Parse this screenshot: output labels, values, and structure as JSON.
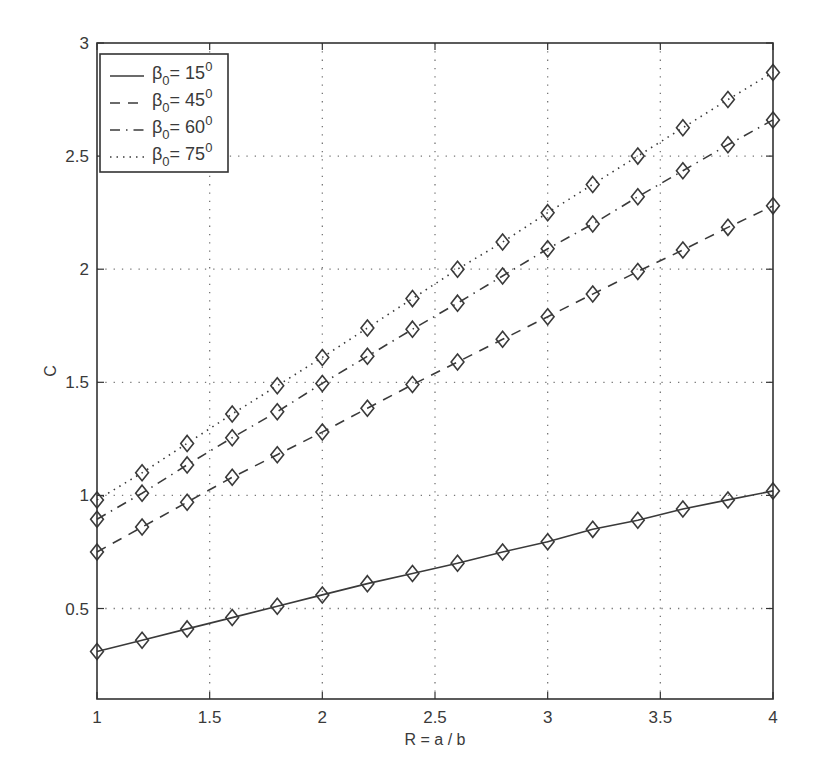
{
  "chart_data": {
    "type": "line",
    "title": "",
    "xlabel": "R = a / b",
    "ylabel": "C",
    "xlim": [
      1,
      4
    ],
    "ylim": [
      0.1,
      3
    ],
    "grid": true,
    "grid_style": "dotted",
    "marker": "diamond",
    "legend_position": "upper-left",
    "xticks": [
      1,
      1.5,
      2,
      2.5,
      3,
      3.5,
      4
    ],
    "xtick_labels": [
      "1",
      "1.5",
      "2",
      "2.5",
      "3",
      "3.5",
      "4"
    ],
    "yticks": [
      0.5,
      1,
      1.5,
      2,
      2.5,
      3
    ],
    "ytick_labels": [
      "0.5",
      "1",
      "1.5",
      "2",
      "2.5",
      "3"
    ],
    "x": [
      1.0,
      1.2,
      1.4,
      1.6,
      1.8,
      2.0,
      2.2,
      2.4,
      2.6,
      2.8,
      3.0,
      3.2,
      3.4,
      3.6,
      3.8,
      4.0
    ],
    "series": [
      {
        "name": "β0 = 15°",
        "legend_main": "β",
        "legend_sub": "0",
        "legend_value": "= 15",
        "legend_sup": "0",
        "line_style": "solid",
        "values": [
          0.31,
          0.36,
          0.41,
          0.46,
          0.51,
          0.56,
          0.61,
          0.655,
          0.7,
          0.75,
          0.795,
          0.85,
          0.89,
          0.94,
          0.98,
          1.02
        ]
      },
      {
        "name": "β0 = 45°",
        "legend_main": "β",
        "legend_sub": "0",
        "legend_value": "= 45",
        "legend_sup": "0",
        "line_style": "dashed",
        "values": [
          0.75,
          0.86,
          0.97,
          1.08,
          1.18,
          1.28,
          1.385,
          1.49,
          1.59,
          1.69,
          1.79,
          1.89,
          1.99,
          2.085,
          2.185,
          2.28
        ]
      },
      {
        "name": "β0 = 60°",
        "legend_main": "β",
        "legend_sub": "0",
        "legend_value": "= 60",
        "legend_sup": "0",
        "line_style": "dashdot",
        "values": [
          0.895,
          1.01,
          1.135,
          1.255,
          1.37,
          1.495,
          1.615,
          1.735,
          1.85,
          1.97,
          2.09,
          2.2,
          2.32,
          2.435,
          2.55,
          2.66
        ]
      },
      {
        "name": "β0 = 75°",
        "legend_main": "β",
        "legend_sub": "0",
        "legend_value": "= 75",
        "legend_sup": "0",
        "line_style": "dotted",
        "values": [
          0.98,
          1.1,
          1.23,
          1.36,
          1.485,
          1.61,
          1.74,
          1.87,
          2.0,
          2.12,
          2.25,
          2.375,
          2.5,
          2.625,
          2.75,
          2.87
        ]
      }
    ],
    "colors": {
      "line": "#3a3a3a",
      "axis": "#333333",
      "grid": "#777777",
      "background": "#ffffff"
    }
  }
}
